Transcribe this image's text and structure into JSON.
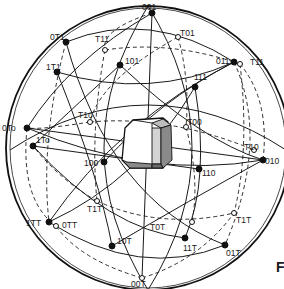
{
  "figure": {
    "type": "stereographic-projection",
    "panel_letter": "F"
  },
  "sphere": {
    "cx": 148,
    "cy": 148,
    "r": 142
  },
  "poles": [
    {
      "id": "p001",
      "label": "001",
      "x": 152,
      "y": 13,
      "lx": 142,
      "ly": 10,
      "filled": true
    },
    {
      "id": "p0m11",
      "label": "0T1",
      "x": 66,
      "y": 42,
      "lx": 50,
      "ly": 40,
      "filled": true
    },
    {
      "id": "pm111a",
      "label": "T11",
      "x": 105,
      "y": 50,
      "lx": 95,
      "ly": 42,
      "filled": false
    },
    {
      "id": "p101",
      "label": "101",
      "x": 120,
      "y": 65,
      "lx": 125,
      "ly": 64,
      "filled": true
    },
    {
      "id": "p1m11",
      "label": "1T1",
      "x": 57,
      "y": 72,
      "lx": 46,
      "ly": 70,
      "filled": true
    },
    {
      "id": "p011",
      "label": "011",
      "x": 234,
      "y": 62,
      "lx": 216,
      "ly": 64,
      "filled": true
    },
    {
      "id": "pm111b",
      "label": "T11",
      "x": 240,
      "y": 64,
      "lx": 250,
      "ly": 65,
      "filled": false
    },
    {
      "id": "pm101",
      "label": "T01",
      "x": 178,
      "y": 37,
      "lx": 180,
      "ly": 36,
      "filled": false
    },
    {
      "id": "p111",
      "label": "111",
      "x": 195,
      "y": 87,
      "lx": 194,
      "ly": 80,
      "filled": true
    },
    {
      "id": "pm1m10",
      "label": "T1o",
      "x": 90,
      "y": 122,
      "lx": 78,
      "ly": 118,
      "filled": false
    },
    {
      "id": "p0m10",
      "label": "0To",
      "x": 27,
      "y": 128,
      "lx": 2,
      "ly": 131,
      "filled": true
    },
    {
      "id": "p1m10",
      "label": "1To",
      "x": 33,
      "y": 146,
      "lx": 36,
      "ly": 143,
      "filled": true
    },
    {
      "id": "p100",
      "label": "100",
      "x": 104,
      "y": 162,
      "lx": 84,
      "ly": 166,
      "filled": true
    },
    {
      "id": "pm100",
      "label": "T00",
      "x": 186,
      "y": 127,
      "lx": 187,
      "ly": 125,
      "filled": false
    },
    {
      "id": "pm110",
      "label": "T10",
      "x": 254,
      "y": 150,
      "lx": 244,
      "ly": 150,
      "filled": false
    },
    {
      "id": "p010",
      "label": "010",
      "x": 263,
      "y": 160,
      "lx": 265,
      "ly": 164,
      "filled": true
    },
    {
      "id": "p110",
      "label": "110",
      "x": 199,
      "y": 169,
      "lx": 202,
      "ly": 176,
      "filled": true
    },
    {
      "id": "p1m1m1",
      "label": "1TT",
      "x": 49,
      "y": 222,
      "lx": 26,
      "ly": 226,
      "filled": true
    },
    {
      "id": "p0m1m1",
      "label": "0TT",
      "x": 56,
      "y": 226,
      "lx": 62,
      "ly": 228,
      "filled": false
    },
    {
      "id": "pm1m1m1",
      "label": "T1T",
      "x": 97,
      "y": 201,
      "lx": 87,
      "ly": 212,
      "filled": false
    },
    {
      "id": "p10m1",
      "label": "10T",
      "x": 112,
      "y": 246,
      "lx": 117,
      "ly": 244,
      "filled": true
    },
    {
      "id": "pm10m1",
      "label": "T0T",
      "x": 192,
      "y": 222,
      "lx": 150,
      "ly": 230,
      "filled": false
    },
    {
      "id": "p11m1",
      "label": "11T",
      "x": 185,
      "y": 238,
      "lx": 183,
      "ly": 251,
      "filled": true
    },
    {
      "id": "p01m1",
      "label": "01T",
      "x": 225,
      "y": 245,
      "lx": 226,
      "ly": 256,
      "filled": true
    },
    {
      "id": "pm11m1",
      "label": "T1T",
      "x": 234,
      "y": 213,
      "lx": 236,
      "ly": 223,
      "filled": false
    },
    {
      "id": "p00m1",
      "label": "00T",
      "x": 142,
      "y": 278,
      "lx": 131,
      "ly": 287,
      "filled": false
    }
  ],
  "great_circles_solid": [
    "M 10 150 Q 148 60 286 150",
    "M 148 6 Q 60 148 148 290",
    "M 148 6 Q 236 148 148 290",
    "M 27 128 Q 150 180 263 160",
    "M 66 42 Q 110 200 225 245",
    "M 234 62 Q 120 120 49 222",
    "M 152 13 L 142 278",
    "M 57 72 Q 150 100 234 62",
    "M 57 72 Q 100 180 112 246",
    "M 195 87 Q 140 180 49 222",
    "M 195 87 Q 210 180 185 238",
    "M 120 65 Q 200 140 263 160",
    "M 120 65 Q 60 120 33 146",
    "M 33 146 Q 110 230 185 238",
    "M 112 246 Q 190 200 263 160",
    "M 66 42 Q 150 8 234 62",
    "M 49 222 Q 140 280 225 245",
    "M 27 128 Q 70 60 152 13",
    "M 27 128 L 263 160",
    "M 33 146 L 199 169",
    "M 104 162 Q 160 100 234 62"
  ],
  "great_circles_dashed": [
    "M 66 42 Q 40 140 49 222",
    "M 234 62 Q 270 140 225 245",
    "M 90 122 Q 170 115 254 150",
    "M 105 50 Q 170 40 240 64",
    "M 105 50 Q 90 130 97 201",
    "M 240 64 Q 250 150 234 213",
    "M 97 201 Q 160 230 234 213",
    "M 178 37 Q 190 80 186 127",
    "M 186 127 Q 200 180 192 222",
    "M 90 122 Q 40 130 27 128",
    "M 152 13 Q 100 30 105 50",
    "M 142 278 Q 200 260 234 213",
    "M 142 278 Q 80 260 56 226",
    "M 27 128 Q 20 200 56 226",
    "M 263 160 Q 270 100 240 64",
    "M 178 37 Q 100 80 90 122",
    "M 97 201 Q 60 180 33 146"
  ]
}
